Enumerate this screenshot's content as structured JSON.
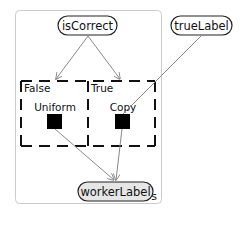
{
  "diagram": {
    "plate": {
      "label": "workers",
      "border_color": "#cccccc",
      "label_color": "#999999"
    },
    "nodes": {
      "isCorrect": {
        "label": "isCorrect"
      },
      "trueLabel": {
        "label": "trueLabel"
      },
      "workerLabel": {
        "label": "workerLabel",
        "fill": "#e6e6e6"
      }
    },
    "gate": {
      "cases": [
        {
          "case_label": "False",
          "factor_label": "Uniform"
        },
        {
          "case_label": "True",
          "factor_label": "Copy"
        }
      ]
    },
    "edges": [
      {
        "from": "isCorrect",
        "to": "gate-False"
      },
      {
        "from": "isCorrect",
        "to": "gate-True"
      },
      {
        "from": "trueLabel",
        "to": "Copy"
      },
      {
        "from": "Uniform",
        "to": "workerLabel"
      },
      {
        "from": "Copy",
        "to": "workerLabel"
      }
    ],
    "colors": {
      "edge": "#888888",
      "node_border": "#222222",
      "factor": "#000000"
    }
  }
}
